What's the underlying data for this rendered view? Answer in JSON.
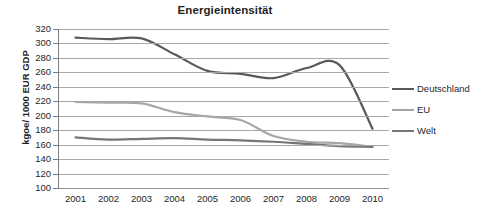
{
  "chart_data": {
    "type": "line",
    "title": "Energieintensität",
    "xlabel": "",
    "ylabel": "kgoe/ 1000 EUR GDP",
    "categories": [
      "2001",
      "2002",
      "2003",
      "2004",
      "2005",
      "2006",
      "2007",
      "2008",
      "2009",
      "2010"
    ],
    "x": [
      2001,
      2002,
      2003,
      2004,
      2005,
      2006,
      2007,
      2008,
      2009,
      2010
    ],
    "ylim": [
      100,
      320
    ],
    "yticks": [
      320,
      300,
      280,
      260,
      240,
      220,
      200,
      180,
      160,
      140,
      120,
      100
    ],
    "grid": true,
    "legend_position": "right",
    "series": [
      {
        "name": "Deutschland",
        "color": "#595959",
        "values": [
          308,
          306,
          307,
          285,
          262,
          258,
          252,
          266,
          270,
          182
        ]
      },
      {
        "name": "EU",
        "color": "#a6a6a6",
        "values": [
          219,
          218,
          217,
          205,
          199,
          194,
          172,
          164,
          162,
          157
        ]
      },
      {
        "name": "Welt",
        "color": "#767676",
        "values": [
          170,
          167,
          168,
          169,
          167,
          166,
          164,
          161,
          158,
          157
        ]
      }
    ]
  },
  "legend": {
    "items": [
      {
        "label": "Deutschland",
        "color": "#595959"
      },
      {
        "label": "EU",
        "color": "#a6a6a6"
      },
      {
        "label": "Welt",
        "color": "#767676"
      }
    ]
  },
  "colors": {
    "gridline": "#a8a8a8",
    "axis": "#7d7d7d",
    "text": "#262626",
    "background": "#ffffff"
  }
}
